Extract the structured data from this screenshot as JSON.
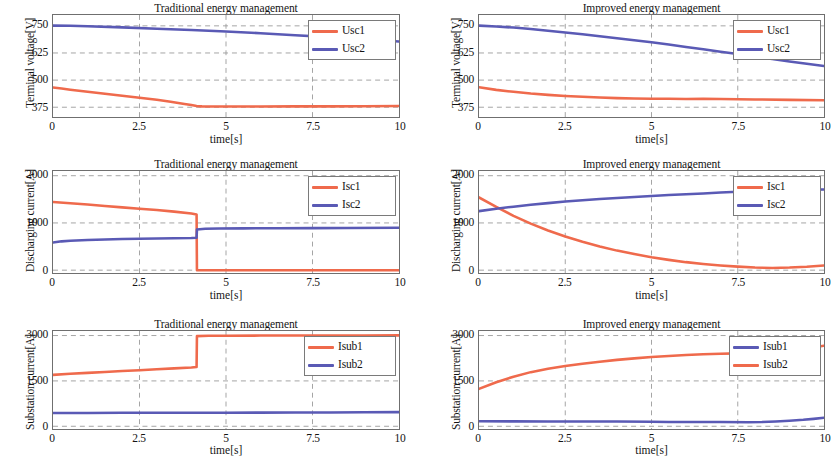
{
  "figure": {
    "width": 835,
    "height": 466,
    "background": "#ffffff"
  },
  "colors": {
    "red": "#ef6a4c",
    "blue": "#5a5ab5",
    "axis": "#6f6f6f",
    "grid": "#9a9a9a",
    "text": "#141414"
  },
  "chart_data": [
    {
      "id": "panel-top-left",
      "type": "line",
      "title": "Traditional energy management",
      "xlabel": "time[s]",
      "ylabel": "Terminal voltage[V]",
      "xlim": [
        0,
        10
      ],
      "ylim": [
        330,
        800
      ],
      "xticks": [
        0,
        2.5,
        5,
        7.5,
        10
      ],
      "xticklabels": [
        "0",
        "2.5",
        "5",
        "7.5",
        "10"
      ],
      "yticks": [
        375,
        500,
        625,
        750
      ],
      "yticklabels": [
        "375",
        "500",
        "625",
        "750"
      ],
      "grid": true,
      "legend_position": "top-right",
      "series": [
        {
          "name": "Usc1",
          "color": "#ef6a4c",
          "x": [
            0,
            0.25,
            0.5,
            1,
            1.5,
            2,
            2.5,
            3,
            3.4,
            3.8,
            4.0,
            4.15,
            4.3,
            4.6,
            5,
            6,
            7,
            8,
            9,
            10
          ],
          "y": [
            466,
            461,
            456,
            446,
            437,
            428,
            419,
            409,
            400,
            390,
            385,
            381,
            379,
            378,
            378,
            378,
            379,
            379,
            380,
            381
          ]
        },
        {
          "name": "Usc2",
          "color": "#5a5ab5",
          "x": [
            0,
            0.5,
            1,
            2,
            3,
            4,
            5,
            6,
            7,
            8,
            9,
            10
          ],
          "y": [
            751,
            750,
            748,
            743,
            737,
            731,
            724,
            716,
            707,
            698,
            688,
            678
          ]
        }
      ]
    },
    {
      "id": "panel-top-right",
      "type": "line",
      "title": "Improved energy management",
      "xlabel": "time[s]",
      "ylabel": "Terminal voltage[V]",
      "xlim": [
        0,
        10
      ],
      "ylim": [
        330,
        800
      ],
      "xticks": [
        0,
        2.5,
        5,
        7.5,
        10
      ],
      "xticklabels": [
        "0",
        "2.5",
        "5",
        "7.5",
        "10"
      ],
      "yticks": [
        375,
        500,
        625,
        750
      ],
      "yticklabels": [
        "375",
        "500",
        "625",
        "750"
      ],
      "grid": true,
      "legend_position": "top-right",
      "series": [
        {
          "name": "Usc1",
          "color": "#ef6a4c",
          "x": [
            0,
            0.5,
            1,
            1.5,
            2,
            2.5,
            3,
            3.5,
            4,
            4.5,
            5,
            5.5,
            6,
            6.5,
            7,
            7.5,
            8,
            9,
            10
          ],
          "y": [
            467,
            455,
            446,
            438,
            432,
            427,
            423,
            420,
            417,
            415,
            414,
            414,
            413,
            414,
            413,
            412,
            411,
            409,
            407
          ]
        },
        {
          "name": "Usc2",
          "color": "#5a5ab5",
          "x": [
            0,
            0.5,
            1,
            1.5,
            2,
            2.5,
            3,
            3.5,
            4,
            4.5,
            5,
            5.5,
            6,
            6.5,
            7,
            7.5,
            8,
            8.5,
            9,
            9.5,
            10
          ],
          "y": [
            751,
            747,
            742,
            735,
            727,
            719,
            711,
            702,
            693,
            684,
            674,
            664,
            653,
            642,
            631,
            620,
            608,
            597,
            586,
            575,
            565
          ]
        }
      ]
    },
    {
      "id": "panel-mid-left",
      "type": "line",
      "title": "Traditional energy management",
      "xlabel": "time[s]",
      "ylabel": "Discharging current[A]",
      "xlim": [
        0,
        10
      ],
      "ylim": [
        -60,
        2100
      ],
      "xticks": [
        0,
        2.5,
        5,
        7.5,
        10
      ],
      "xticklabels": [
        "0",
        "2.5",
        "5",
        "7.5",
        "10"
      ],
      "yticks": [
        0,
        1000,
        2000
      ],
      "yticklabels": [
        "0",
        "1000",
        "2000"
      ],
      "grid": true,
      "legend_position": "top-right",
      "series": [
        {
          "name": "Isc1",
          "color": "#ef6a4c",
          "x": [
            0,
            0.5,
            1,
            1.5,
            2,
            2.5,
            3,
            3.5,
            4,
            4.15,
            4.16,
            5,
            6,
            7,
            8,
            9,
            10
          ],
          "y": [
            1445,
            1415,
            1390,
            1360,
            1330,
            1300,
            1272,
            1240,
            1200,
            1180,
            0,
            0,
            0,
            0,
            0,
            0,
            0
          ]
        },
        {
          "name": "Isc2",
          "color": "#5a5ab5",
          "x": [
            0,
            0.25,
            0.5,
            1,
            1.5,
            2,
            2.5,
            3,
            3.5,
            4,
            4.15,
            4.16,
            4.4,
            4.8,
            5.5,
            6.5,
            7.5,
            8.5,
            10
          ],
          "y": [
            585,
            610,
            625,
            640,
            650,
            658,
            665,
            670,
            675,
            682,
            688,
            860,
            875,
            882,
            885,
            888,
            890,
            892,
            898
          ]
        }
      ]
    },
    {
      "id": "panel-mid-right",
      "type": "line",
      "title": "Improved energy management",
      "xlabel": "time[s]",
      "ylabel": "Discharging current[A]",
      "xlim": [
        0,
        10
      ],
      "ylim": [
        -60,
        2100
      ],
      "xticks": [
        0,
        2.5,
        5,
        7.5,
        10
      ],
      "xticklabels": [
        "0",
        "2.5",
        "5",
        "7.5",
        "10"
      ],
      "yticks": [
        0,
        1000,
        2000
      ],
      "yticklabels": [
        "0",
        "1000",
        "2000"
      ],
      "grid": true,
      "legend_position": "top-right",
      "series": [
        {
          "name": "Isc1",
          "color": "#ef6a4c",
          "x": [
            0,
            0.5,
            1,
            1.5,
            2,
            2.5,
            3,
            3.5,
            4,
            4.5,
            5,
            5.5,
            6,
            6.5,
            7,
            7.5,
            8,
            8.5,
            9,
            9.5,
            10
          ],
          "y": [
            1540,
            1340,
            1150,
            985,
            840,
            712,
            600,
            500,
            414,
            340,
            272,
            218,
            170,
            132,
            100,
            75,
            55,
            48,
            55,
            72,
            98
          ]
        },
        {
          "name": "Isc2",
          "color": "#5a5ab5",
          "x": [
            0,
            0.5,
            1,
            1.5,
            2,
            2.5,
            3,
            3.5,
            4,
            4.5,
            5,
            5.5,
            6,
            6.5,
            7,
            7.5,
            8,
            8.5,
            9,
            9.5,
            10
          ],
          "y": [
            1250,
            1300,
            1345,
            1385,
            1420,
            1452,
            1480,
            1505,
            1528,
            1550,
            1570,
            1590,
            1608,
            1625,
            1645,
            1662,
            1680,
            1692,
            1700,
            1706,
            1710
          ]
        }
      ]
    },
    {
      "id": "panel-bot-left",
      "type": "line",
      "title": "Traditional energy management",
      "xlabel": "time[s]",
      "ylabel": "Substation current[A]",
      "xlim": [
        0,
        10
      ],
      "ylim": [
        -90,
        3150
      ],
      "xticks": [
        0,
        2.5,
        5,
        7.5,
        10
      ],
      "xticklabels": [
        "0",
        "2.5",
        "5",
        "7.5",
        "10"
      ],
      "yticks": [
        0,
        1500,
        3000
      ],
      "yticklabels": [
        "0",
        "1500",
        "3000"
      ],
      "grid": true,
      "legend_position": "top-right",
      "series": [
        {
          "name": "Isub1",
          "color": "#ef6a4c",
          "x": [
            0,
            0.5,
            1,
            1.5,
            2,
            2.5,
            3,
            3.5,
            4,
            4.15,
            4.16,
            4.5,
            5,
            6,
            7,
            8,
            9,
            10
          ],
          "y": [
            1700,
            1735,
            1765,
            1795,
            1825,
            1855,
            1885,
            1915,
            1945,
            1960,
            2980,
            2990,
            2995,
            2998,
            3000,
            3000,
            3002,
            3005
          ]
        },
        {
          "name": "Isub2",
          "color": "#5a5ab5",
          "x": [
            0,
            1,
            2,
            3,
            4,
            5,
            6,
            7,
            8,
            9,
            10
          ],
          "y": [
            440,
            442,
            444,
            446,
            448,
            450,
            452,
            455,
            458,
            462,
            468
          ]
        }
      ]
    },
    {
      "id": "panel-bot-right",
      "type": "line",
      "title": "Improved energy management",
      "xlabel": "time[s]",
      "ylabel": "Substation current[A]",
      "xlim": [
        0,
        10
      ],
      "ylim": [
        -90,
        3150
      ],
      "xticks": [
        0,
        2.5,
        5,
        7.5,
        10
      ],
      "xticklabels": [
        "0",
        "2.5",
        "5",
        "7.5",
        "10"
      ],
      "yticks": [
        0,
        1500,
        3000
      ],
      "yticklabels": [
        "0",
        "1500",
        "3000"
      ],
      "grid": true,
      "legend_position": "top-right",
      "legend_order": [
        "Isub1",
        "Isub2"
      ],
      "series": [
        {
          "name": "Isub1",
          "color": "#5a5ab5",
          "x": [
            0,
            1,
            2,
            3,
            4,
            5,
            5.5,
            6,
            7,
            7.8,
            8.2,
            8.6,
            9,
            9.4,
            9.7,
            10
          ],
          "y": [
            165,
            162,
            160,
            158,
            156,
            150,
            138,
            140,
            140,
            132,
            140,
            160,
            185,
            215,
            245,
            280
          ]
        },
        {
          "name": "Isub2",
          "color": "#ef6a4c",
          "x": [
            0,
            0.5,
            1,
            1.5,
            2,
            2.5,
            3,
            3.5,
            4,
            4.5,
            5,
            5.5,
            6,
            6.5,
            7,
            7.5,
            7.9,
            8.3,
            8.8,
            9.3,
            9.7,
            10
          ],
          "y": [
            1235,
            1455,
            1640,
            1790,
            1905,
            1990,
            2070,
            2135,
            2195,
            2245,
            2290,
            2325,
            2355,
            2380,
            2395,
            2410,
            2418,
            2440,
            2490,
            2550,
            2610,
            2660
          ]
        }
      ]
    }
  ]
}
